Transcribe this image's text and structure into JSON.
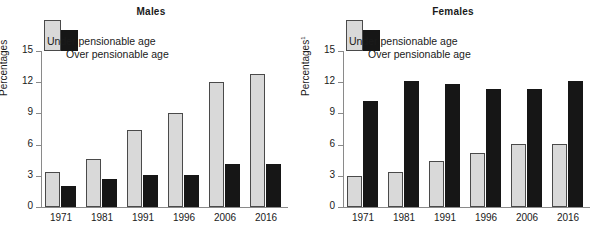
{
  "chart_data": [
    {
      "type": "bar",
      "title": "Males",
      "xlabel": "",
      "ylabel": "Percentages",
      "ylabel_superscript": "",
      "categories": [
        "1971",
        "1981",
        "1991",
        "1996",
        "2006",
        "2016"
      ],
      "yticks": [
        0,
        3,
        6,
        9,
        12,
        15
      ],
      "ylim": [
        0,
        15
      ],
      "grid": false,
      "legend": [
        "Under pensionable age",
        "Over pensionable age"
      ],
      "legend_position": "top-left-inside",
      "series": [
        {
          "name": "Under pensionable age",
          "color": "#d9d9d9",
          "values": [
            3.35,
            4.65,
            7.4,
            9.05,
            12.05,
            12.8
          ]
        },
        {
          "name": "Over pensionable age",
          "color": "#161616",
          "values": [
            2.0,
            2.7,
            3.05,
            3.05,
            4.1,
            4.1
          ]
        }
      ]
    },
    {
      "type": "bar",
      "title": "Females",
      "xlabel": "",
      "ylabel": "Percentages",
      "ylabel_superscript": "1",
      "categories": [
        "1971",
        "1981",
        "1991",
        "1996",
        "2006",
        "2016"
      ],
      "yticks": [
        0,
        3,
        6,
        9,
        12,
        15
      ],
      "ylim": [
        0,
        15
      ],
      "grid": false,
      "legend": [
        "Under pensionable age",
        "Over pensionable age"
      ],
      "legend_position": "top-left-inside",
      "series": [
        {
          "name": "Under pensionable age",
          "color": "#d9d9d9",
          "values": [
            3.0,
            3.4,
            4.4,
            5.2,
            6.05,
            6.05
          ]
        },
        {
          "name": "Over pensionable age",
          "color": "#161616",
          "values": [
            10.2,
            12.1,
            11.8,
            11.3,
            11.3,
            12.1
          ]
        }
      ]
    }
  ],
  "males": {
    "title": "Males",
    "ylabel": "Percentages",
    "ylabel_sup": "",
    "legend": {
      "under": "Under pensionable age",
      "over": "Over pensionable age"
    },
    "yticks": [
      "15",
      "12",
      "9",
      "6",
      "3",
      "0"
    ],
    "xticks": [
      "1971",
      "1981",
      "1991",
      "1996",
      "2006",
      "2016"
    ]
  },
  "females": {
    "title": "Females",
    "ylabel": "Percentages",
    "ylabel_sup": "1",
    "legend": {
      "under": "Under pensionable age",
      "over": "Over pensionable age"
    },
    "yticks": [
      "15",
      "12",
      "9",
      "6",
      "3",
      "0"
    ],
    "xticks": [
      "1971",
      "1981",
      "1991",
      "1996",
      "2006",
      "2016"
    ]
  }
}
